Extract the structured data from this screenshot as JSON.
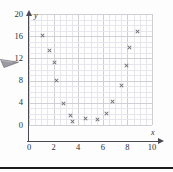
{
  "figure": {
    "axis_name_x": "x",
    "axis_name_y": "y",
    "cursor_icon": "arrow-cursor-icon",
    "marker_icon": "x-marker-icon",
    "colors": {
      "axis": "#4a4a52",
      "grid_major": "#cfcfd6",
      "grid_minor": "#e6e6ec",
      "marker": "#6b6b74",
      "background": "#fdfdfd",
      "rule": "#1b1b1b"
    }
  },
  "chart_data": {
    "type": "scatter",
    "title": "",
    "subtitle": "",
    "xlabel": "x",
    "ylabel": "y",
    "xlim": [
      0,
      10
    ],
    "ylim": [
      0,
      20
    ],
    "grid": true,
    "legend": null,
    "x_ticks": [
      0,
      2,
      4,
      6,
      8,
      10
    ],
    "y_ticks": [
      0,
      4,
      8,
      12,
      16,
      20
    ],
    "x_tick_labels": [
      "0",
      "2",
      "4",
      "6",
      "8",
      "10"
    ],
    "y_tick_labels": [
      "0",
      "4",
      "8",
      "12",
      "16",
      "20"
    ],
    "x_minor_step": 0.5,
    "y_minor_step": 1,
    "marker_style": "x",
    "series": [
      {
        "name": "",
        "points": [
          [
            1.1,
            16.1
          ],
          [
            1.7,
            13.4
          ],
          [
            2.1,
            11.2
          ],
          [
            2.2,
            8.1
          ],
          [
            2.8,
            3.9
          ],
          [
            3.4,
            1.7
          ],
          [
            3.5,
            0.6
          ],
          [
            4.6,
            1.1
          ],
          [
            5.6,
            1.0
          ],
          [
            6.3,
            2.0
          ],
          [
            6.8,
            4.3
          ],
          [
            7.5,
            7.2
          ],
          [
            7.9,
            10.8
          ],
          [
            8.2,
            13.9
          ],
          [
            8.8,
            16.9
          ]
        ]
      }
    ]
  }
}
